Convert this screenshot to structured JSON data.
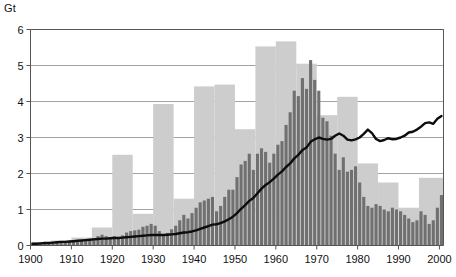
{
  "chart": {
    "unit_label": "Gt",
    "y_ticks": [
      "0",
      "1",
      "2",
      "3",
      "4",
      "5",
      "6"
    ],
    "x_ticks": [
      "1900",
      "1910",
      "1920",
      "1930",
      "1940",
      "1950",
      "1960",
      "1970",
      "1980",
      "1990",
      "2000"
    ]
  },
  "colors": {
    "light_bar": "#cdcdcd",
    "dark_bar": "#707070",
    "line": "#0d0d0d",
    "grid": "#8c8c8c",
    "axis": "#555555",
    "text": "#111111",
    "background": "#ffffff"
  },
  "chart_data": {
    "type": "bar",
    "title": "",
    "xlabel": "",
    "ylabel": "Gt",
    "xlim": [
      1900,
      2001
    ],
    "ylim": [
      0,
      6
    ],
    "grid": true,
    "legend": "none",
    "x": [
      1900,
      1901,
      1902,
      1903,
      1904,
      1905,
      1906,
      1907,
      1908,
      1909,
      1910,
      1911,
      1912,
      1913,
      1914,
      1915,
      1916,
      1917,
      1918,
      1919,
      1920,
      1921,
      1922,
      1923,
      1924,
      1925,
      1926,
      1927,
      1928,
      1929,
      1930,
      1931,
      1932,
      1933,
      1934,
      1935,
      1936,
      1937,
      1938,
      1939,
      1940,
      1941,
      1942,
      1943,
      1944,
      1945,
      1946,
      1947,
      1948,
      1949,
      1950,
      1951,
      1952,
      1953,
      1954,
      1955,
      1956,
      1957,
      1958,
      1959,
      1960,
      1961,
      1962,
      1963,
      1964,
      1965,
      1966,
      1967,
      1968,
      1969,
      1970,
      1971,
      1972,
      1973,
      1974,
      1975,
      1976,
      1977,
      1978,
      1979,
      1980,
      1981,
      1982,
      1983,
      1984,
      1985,
      1986,
      1987,
      1988,
      1989,
      1990,
      1991,
      1992,
      1993,
      1994,
      1995,
      1996,
      1997,
      1998,
      1999,
      2000
    ],
    "series": [
      {
        "name": "5-year maximum band",
        "type": "bar",
        "color": "#cdcdcd",
        "band_years": 5,
        "bands": [
          {
            "start": 1900,
            "end": 1905,
            "value": 0.1
          },
          {
            "start": 1905,
            "end": 1910,
            "value": 0.14
          },
          {
            "start": 1910,
            "end": 1915,
            "value": 0.22
          },
          {
            "start": 1915,
            "end": 1920,
            "value": 0.5
          },
          {
            "start": 1920,
            "end": 1925,
            "value": 2.52
          },
          {
            "start": 1925,
            "end": 1930,
            "value": 0.88
          },
          {
            "start": 1930,
            "end": 1935,
            "value": 3.93
          },
          {
            "start": 1935,
            "end": 1940,
            "value": 1.3
          },
          {
            "start": 1940,
            "end": 1945,
            "value": 4.42
          },
          {
            "start": 1945,
            "end": 1950,
            "value": 4.47
          },
          {
            "start": 1950,
            "end": 1955,
            "value": 3.23
          },
          {
            "start": 1955,
            "end": 1960,
            "value": 5.53
          },
          {
            "start": 1960,
            "end": 1965,
            "value": 5.67
          },
          {
            "start": 1965,
            "end": 1970,
            "value": 5.05
          },
          {
            "start": 1970,
            "end": 1975,
            "value": 3.62
          },
          {
            "start": 1975,
            "end": 1980,
            "value": 4.13
          },
          {
            "start": 1980,
            "end": 1985,
            "value": 2.28
          },
          {
            "start": 1985,
            "end": 1990,
            "value": 1.75
          },
          {
            "start": 1990,
            "end": 1995,
            "value": 1.05
          },
          {
            "start": 1995,
            "end": 2001,
            "value": 1.88
          }
        ]
      },
      {
        "name": "Annual bars",
        "type": "bar",
        "color": "#707070",
        "values": [
          0.05,
          0.05,
          0.06,
          0.07,
          0.07,
          0.08,
          0.09,
          0.1,
          0.09,
          0.1,
          0.11,
          0.12,
          0.13,
          0.16,
          0.18,
          0.2,
          0.26,
          0.3,
          0.26,
          0.22,
          0.26,
          0.22,
          0.28,
          0.36,
          0.4,
          0.42,
          0.44,
          0.52,
          0.55,
          0.6,
          0.55,
          0.4,
          0.3,
          0.35,
          0.45,
          0.55,
          0.7,
          0.85,
          0.75,
          0.9,
          1.05,
          1.2,
          1.25,
          1.3,
          1.35,
          0.95,
          1.1,
          1.35,
          1.55,
          1.55,
          1.9,
          2.25,
          2.35,
          2.55,
          2.1,
          2.55,
          2.7,
          2.6,
          2.3,
          2.55,
          2.8,
          2.9,
          3.35,
          3.7,
          4.3,
          4.15,
          4.65,
          4.35,
          5.15,
          4.6,
          4.3,
          3.55,
          3.45,
          3.05,
          2.55,
          2.1,
          2.45,
          2.05,
          2.1,
          2.2,
          1.75,
          1.35,
          1.1,
          1.05,
          1.15,
          1.1,
          1.0,
          0.95,
          1.05,
          1.0,
          0.95,
          0.85,
          0.75,
          0.65,
          0.7,
          0.95,
          0.85,
          0.6,
          0.7,
          1.05,
          1.4
        ]
      },
      {
        "name": "Cumulative trend line",
        "type": "line",
        "color": "#0d0d0d",
        "values": [
          0.05,
          0.05,
          0.06,
          0.07,
          0.07,
          0.08,
          0.09,
          0.1,
          0.1,
          0.11,
          0.12,
          0.13,
          0.14,
          0.15,
          0.16,
          0.17,
          0.18,
          0.19,
          0.19,
          0.2,
          0.21,
          0.21,
          0.22,
          0.23,
          0.24,
          0.25,
          0.26,
          0.27,
          0.28,
          0.29,
          0.29,
          0.29,
          0.29,
          0.3,
          0.31,
          0.32,
          0.34,
          0.36,
          0.37,
          0.39,
          0.42,
          0.46,
          0.5,
          0.54,
          0.58,
          0.59,
          0.62,
          0.67,
          0.73,
          0.8,
          0.9,
          1.02,
          1.12,
          1.24,
          1.32,
          1.45,
          1.58,
          1.68,
          1.76,
          1.86,
          1.97,
          2.06,
          2.18,
          2.28,
          2.42,
          2.52,
          2.65,
          2.72,
          2.88,
          2.95,
          3.0,
          2.96,
          2.94,
          2.96,
          3.05,
          3.11,
          3.05,
          2.94,
          2.92,
          2.95,
          3.0,
          3.1,
          3.22,
          3.12,
          2.96,
          2.9,
          2.93,
          2.98,
          2.95,
          2.96,
          3.0,
          3.05,
          3.14,
          3.16,
          3.22,
          3.3,
          3.4,
          3.42,
          3.38,
          3.52,
          3.6
        ]
      }
    ]
  }
}
